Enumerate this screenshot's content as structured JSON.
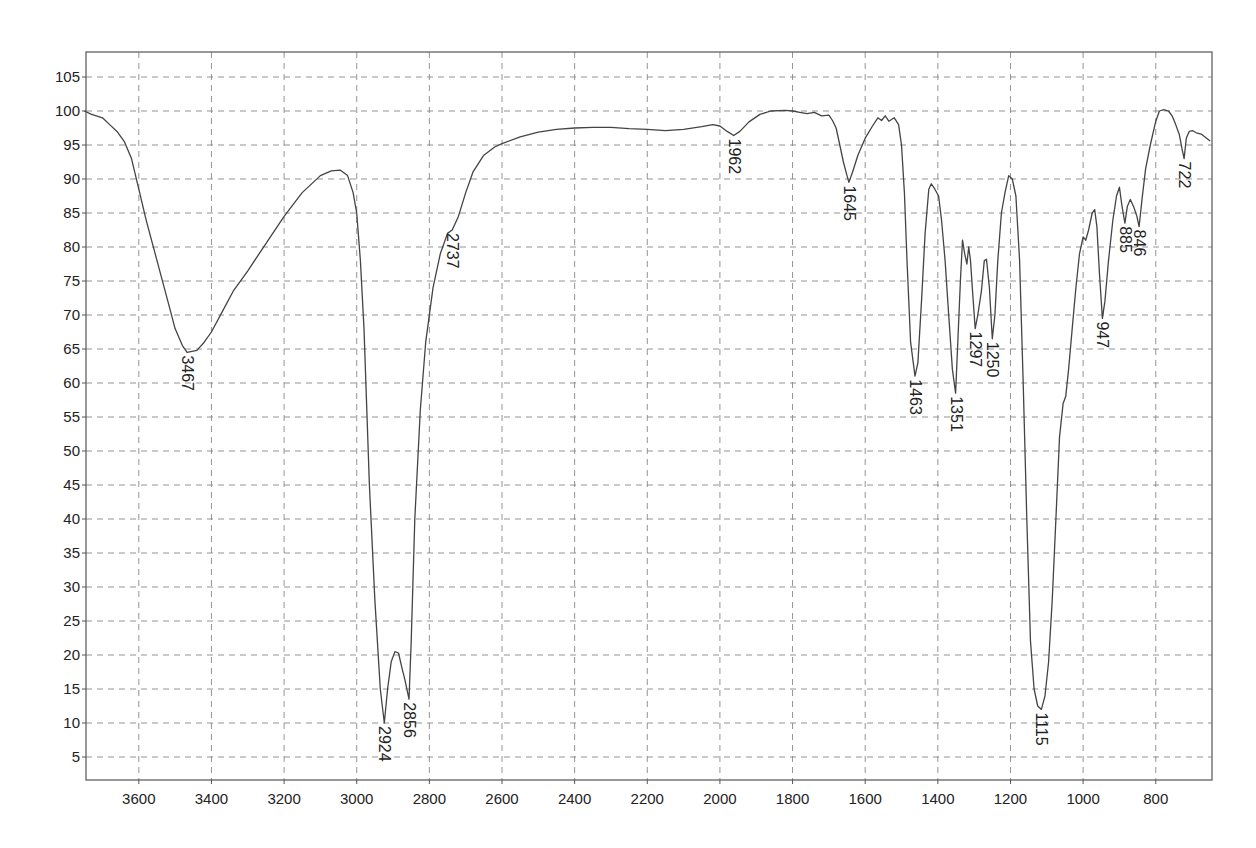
{
  "chart_data": {
    "type": "line",
    "title": "",
    "xlabel": "",
    "ylabel": "",
    "xlim": [
      3750,
      650
    ],
    "ylim": [
      0,
      109
    ],
    "x_reversed": true,
    "grid": true,
    "grid_style": "dashed",
    "legend": null,
    "x_ticks": [
      3600,
      3400,
      3200,
      3000,
      2800,
      2600,
      2400,
      2200,
      2000,
      1800,
      1600,
      1400,
      1200,
      1000,
      800
    ],
    "y_ticks": [
      5,
      10,
      15,
      20,
      25,
      30,
      35,
      40,
      45,
      50,
      55,
      60,
      65,
      70,
      75,
      80,
      85,
      90,
      95,
      100,
      105
    ],
    "series": [
      {
        "name": "IR spectrum (%T)",
        "color": "#444444",
        "points": [
          [
            3750,
            100
          ],
          [
            3730,
            99.5
          ],
          [
            3700,
            99
          ],
          [
            3680,
            98
          ],
          [
            3660,
            97
          ],
          [
            3640,
            95.5
          ],
          [
            3620,
            93
          ],
          [
            3600,
            88.5
          ],
          [
            3580,
            84
          ],
          [
            3550,
            78
          ],
          [
            3520,
            72
          ],
          [
            3500,
            68
          ],
          [
            3480,
            65.5
          ],
          [
            3467,
            64.5
          ],
          [
            3440,
            64.8
          ],
          [
            3420,
            66
          ],
          [
            3400,
            67.5
          ],
          [
            3370,
            70.5
          ],
          [
            3340,
            73.5
          ],
          [
            3300,
            76.5
          ],
          [
            3250,
            80.5
          ],
          [
            3200,
            84.5
          ],
          [
            3150,
            88
          ],
          [
            3100,
            90.5
          ],
          [
            3070,
            91.2
          ],
          [
            3045,
            91.3
          ],
          [
            3025,
            90.5
          ],
          [
            3010,
            88
          ],
          [
            3000,
            85
          ],
          [
            2990,
            78
          ],
          [
            2980,
            68
          ],
          [
            2965,
            45
          ],
          [
            2950,
            28
          ],
          [
            2935,
            15
          ],
          [
            2924,
            10
          ],
          [
            2915,
            15
          ],
          [
            2905,
            19
          ],
          [
            2895,
            20.5
          ],
          [
            2885,
            20.3
          ],
          [
            2875,
            18
          ],
          [
            2868,
            16.5
          ],
          [
            2856,
            13.5
          ],
          [
            2850,
            22
          ],
          [
            2840,
            40
          ],
          [
            2825,
            56
          ],
          [
            2810,
            66
          ],
          [
            2790,
            74
          ],
          [
            2770,
            79
          ],
          [
            2750,
            82
          ],
          [
            2737,
            82.5
          ],
          [
            2720,
            84.5
          ],
          [
            2700,
            88
          ],
          [
            2680,
            91
          ],
          [
            2650,
            93.5
          ],
          [
            2620,
            94.7
          ],
          [
            2600,
            95.2
          ],
          [
            2550,
            96.2
          ],
          [
            2500,
            96.9
          ],
          [
            2450,
            97.3
          ],
          [
            2400,
            97.5
          ],
          [
            2350,
            97.6
          ],
          [
            2300,
            97.6
          ],
          [
            2250,
            97.4
          ],
          [
            2200,
            97.3
          ],
          [
            2150,
            97.1
          ],
          [
            2100,
            97.3
          ],
          [
            2050,
            97.7
          ],
          [
            2020,
            98
          ],
          [
            2000,
            97.8
          ],
          [
            1980,
            97
          ],
          [
            1962,
            96.4
          ],
          [
            1945,
            97
          ],
          [
            1920,
            98.4
          ],
          [
            1890,
            99.5
          ],
          [
            1860,
            100
          ],
          [
            1820,
            100.1
          ],
          [
            1800,
            100
          ],
          [
            1780,
            99.8
          ],
          [
            1760,
            99.6
          ],
          [
            1740,
            99.8
          ],
          [
            1720,
            99.3
          ],
          [
            1700,
            99.4
          ],
          [
            1690,
            98.6
          ],
          [
            1680,
            97.5
          ],
          [
            1670,
            95
          ],
          [
            1660,
            92.5
          ],
          [
            1650,
            90.5
          ],
          [
            1645,
            89.5
          ],
          [
            1635,
            91
          ],
          [
            1620,
            93.5
          ],
          [
            1600,
            96
          ],
          [
            1580,
            97.8
          ],
          [
            1565,
            99
          ],
          [
            1555,
            98.6
          ],
          [
            1545,
            99.3
          ],
          [
            1535,
            98.5
          ],
          [
            1520,
            99
          ],
          [
            1508,
            98
          ],
          [
            1500,
            95
          ],
          [
            1492,
            88
          ],
          [
            1485,
            78
          ],
          [
            1475,
            66
          ],
          [
            1463,
            61
          ],
          [
            1455,
            63
          ],
          [
            1445,
            72
          ],
          [
            1435,
            82
          ],
          [
            1425,
            88.5
          ],
          [
            1418,
            89.3
          ],
          [
            1408,
            88.5
          ],
          [
            1398,
            87.5
          ],
          [
            1390,
            84
          ],
          [
            1380,
            78
          ],
          [
            1370,
            70
          ],
          [
            1360,
            62
          ],
          [
            1351,
            58.5
          ],
          [
            1345,
            66
          ],
          [
            1338,
            75
          ],
          [
            1332,
            81
          ],
          [
            1326,
            79
          ],
          [
            1320,
            77.5
          ],
          [
            1315,
            80
          ],
          [
            1310,
            78
          ],
          [
            1305,
            74
          ],
          [
            1297,
            68
          ],
          [
            1290,
            70
          ],
          [
            1280,
            73.5
          ],
          [
            1272,
            78
          ],
          [
            1266,
            78.2
          ],
          [
            1258,
            74
          ],
          [
            1250,
            66.5
          ],
          [
            1243,
            70
          ],
          [
            1235,
            78
          ],
          [
            1225,
            85
          ],
          [
            1215,
            88
          ],
          [
            1205,
            90.5
          ],
          [
            1195,
            90
          ],
          [
            1185,
            87.5
          ],
          [
            1175,
            78
          ],
          [
            1165,
            60
          ],
          [
            1155,
            40
          ],
          [
            1145,
            22
          ],
          [
            1135,
            15
          ],
          [
            1125,
            12.5
          ],
          [
            1115,
            12
          ],
          [
            1105,
            14
          ],
          [
            1095,
            19
          ],
          [
            1085,
            28
          ],
          [
            1075,
            40
          ],
          [
            1065,
            52
          ],
          [
            1055,
            57
          ],
          [
            1048,
            58
          ],
          [
            1040,
            62
          ],
          [
            1030,
            68
          ],
          [
            1020,
            74
          ],
          [
            1010,
            79
          ],
          [
            1000,
            81.5
          ],
          [
            993,
            81
          ],
          [
            985,
            82.5
          ],
          [
            975,
            85
          ],
          [
            968,
            85.5
          ],
          [
            962,
            83
          ],
          [
            955,
            76
          ],
          [
            947,
            69.5
          ],
          [
            940,
            72
          ],
          [
            930,
            78
          ],
          [
            918,
            84
          ],
          [
            908,
            87.5
          ],
          [
            900,
            88.8
          ],
          [
            893,
            86
          ],
          [
            885,
            83.5
          ],
          [
            878,
            86
          ],
          [
            870,
            87
          ],
          [
            860,
            85.8
          ],
          [
            852,
            84.5
          ],
          [
            846,
            83
          ],
          [
            838,
            87
          ],
          [
            828,
            91.5
          ],
          [
            815,
            95
          ],
          [
            800,
            98.5
          ],
          [
            790,
            100
          ],
          [
            778,
            100.2
          ],
          [
            765,
            100
          ],
          [
            755,
            99.3
          ],
          [
            745,
            98
          ],
          [
            735,
            96.5
          ],
          [
            728,
            94.5
          ],
          [
            722,
            93
          ],
          [
            716,
            96
          ],
          [
            708,
            97
          ],
          [
            698,
            97.1
          ],
          [
            688,
            96.8
          ],
          [
            675,
            96.6
          ],
          [
            660,
            96
          ],
          [
            650,
            95.6
          ]
        ]
      }
    ],
    "annotations": [
      {
        "label": "3467",
        "x": 3467,
        "y": 64.5
      },
      {
        "label": "2924",
        "x": 2924,
        "y": 10
      },
      {
        "label": "2856",
        "x": 2856,
        "y": 13.5
      },
      {
        "label": "2737",
        "x": 2737,
        "y": 82.5
      },
      {
        "label": "1962",
        "x": 1962,
        "y": 96.4
      },
      {
        "label": "1645",
        "x": 1645,
        "y": 89.5
      },
      {
        "label": "1463",
        "x": 1463,
        "y": 61
      },
      {
        "label": "1351",
        "x": 1351,
        "y": 58.5
      },
      {
        "label": "1297",
        "x": 1297,
        "y": 68
      },
      {
        "label": "1250",
        "x": 1250,
        "y": 66.5
      },
      {
        "label": "1115",
        "x": 1115,
        "y": 12
      },
      {
        "label": "947",
        "x": 947,
        "y": 69.5
      },
      {
        "label": "885",
        "x": 885,
        "y": 83.5
      },
      {
        "label": "846",
        "x": 846,
        "y": 83
      },
      {
        "label": "722",
        "x": 722,
        "y": 93
      }
    ]
  },
  "style": {
    "line_color": "#444444",
    "grid_color": "#888888",
    "axis_color": "#555555",
    "background": "#ffffff"
  }
}
